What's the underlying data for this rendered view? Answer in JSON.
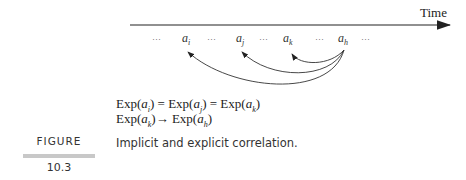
{
  "diagram": {
    "axis_label": "Time",
    "sequence": [
      "...",
      "a_i",
      "...",
      "a_j",
      "...",
      "a_k",
      "...",
      "a_h",
      "..."
    ],
    "sequence_labels": {
      "dots": "···",
      "ai": "a",
      "ai_sub": "i",
      "aj": "a",
      "aj_sub": "j",
      "ak": "a",
      "ak_sub": "k",
      "ah": "a",
      "ah_sub": "h"
    },
    "arrows": [
      {
        "from": "a_h",
        "to": "a_i"
      },
      {
        "from": "a_h",
        "to": "a_j"
      },
      {
        "from": "a_h",
        "to": "a_k"
      }
    ]
  },
  "formulas": {
    "line1": {
      "p1": "Exp(",
      "a1": "a",
      "s1": "i",
      "p2": ") = Exp(",
      "a2": "a",
      "s2": "j",
      "p3": ") = Exp(",
      "a3": "a",
      "s3": "k",
      "p4": ")"
    },
    "line2": {
      "p1": "Exp(",
      "a1": "a",
      "s1": "k",
      "p2": ")→ Exp(",
      "a2": "a",
      "s2": "h",
      "p3": ")"
    }
  },
  "figure": {
    "label": "FIGURE",
    "number": "10.3",
    "caption": "Implicit and explicit correlation."
  }
}
